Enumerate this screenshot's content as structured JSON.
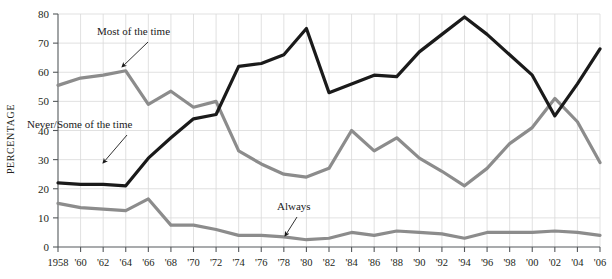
{
  "chart_data": {
    "type": "line",
    "title": "",
    "subtitle": "",
    "xlabel": "",
    "ylabel": "PERCENTAGE",
    "ylim": [
      0,
      80
    ],
    "xlim": [
      1958,
      2006
    ],
    "ytick_step": 10,
    "xtick_step": 2,
    "grid": true,
    "legend_position": "inline-annotations",
    "ytick_labels": [
      "0",
      "10",
      "20",
      "30",
      "40",
      "50",
      "60",
      "70",
      "80"
    ],
    "ytick_values": [
      0,
      10,
      20,
      30,
      40,
      50,
      60,
      70,
      80
    ],
    "xtick_labels": [
      "1958",
      "'60",
      "'62",
      "'64",
      "'66",
      "'68",
      "'70",
      "'72",
      "'74",
      "'76",
      "'78",
      "'80",
      "'82",
      "'84",
      "'86",
      "'88",
      "'90",
      "'92",
      "'94",
      "'96",
      "'98",
      "'00",
      "'02",
      "'04",
      "'06"
    ],
    "x": [
      1958,
      1960,
      1962,
      1964,
      1966,
      1968,
      1970,
      1972,
      1974,
      1976,
      1978,
      1980,
      1982,
      1984,
      1986,
      1988,
      1990,
      1992,
      1994,
      1996,
      1998,
      2000,
      2002,
      2004,
      2006
    ],
    "series": [
      {
        "name": "Most of the time",
        "color": "#8c8c8c",
        "values": [
          55.5,
          58,
          59,
          60.5,
          49,
          53.5,
          48,
          50,
          33,
          28.5,
          25,
          24,
          27,
          40,
          33,
          37.5,
          30.5,
          26,
          21,
          27,
          35.5,
          41,
          51,
          43,
          29
        ]
      },
      {
        "name": "Never/Some of the time",
        "color": "#1a1a1a",
        "values": [
          22,
          21.5,
          21.5,
          21,
          30.5,
          37.5,
          44,
          45.5,
          62,
          63,
          66,
          75,
          53,
          56,
          59,
          58.5,
          67,
          73,
          79,
          73,
          66,
          59,
          45,
          56,
          68
        ]
      },
      {
        "name": "Always",
        "color": "#8c8c8c",
        "values": [
          15,
          13.5,
          13,
          12.5,
          16.5,
          7.5,
          7.5,
          6,
          4,
          4,
          3.5,
          2.5,
          3,
          5,
          4,
          5.5,
          5,
          4.5,
          3,
          5,
          5,
          5,
          5.5,
          5,
          4
        ]
      }
    ],
    "annotations": [
      {
        "name": "most-of-the-time",
        "text": "Most of the time",
        "text_x": 97,
        "text_y": 35,
        "arrow_x1": 148,
        "arrow_y1": 42,
        "arrow_x2": 122,
        "arrow_y2": 67
      },
      {
        "name": "never-some-of-the-time",
        "text": "Never/Some of the time",
        "text_x": 27,
        "text_y": 128,
        "arrow_x1": 127,
        "arrow_y1": 135,
        "arrow_x2": 103,
        "arrow_y2": 163
      },
      {
        "name": "always",
        "text": "Always",
        "text_x": 277,
        "text_y": 210,
        "arrow_x1": 297,
        "arrow_y1": 217,
        "arrow_x2": 285,
        "arrow_y2": 236
      }
    ]
  }
}
